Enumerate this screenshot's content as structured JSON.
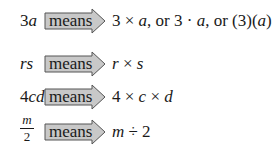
{
  "arrow": {
    "label": "means",
    "fill": "#c8c8c8",
    "stroke": "#555555"
  },
  "rows": [
    {
      "lhs_num": "3",
      "lhs_var": "a",
      "rhs": "3 × a, or 3 · a, or (3)(a)"
    },
    {
      "lhs_var": "rs",
      "rhs": "r × s"
    },
    {
      "lhs_num": "4",
      "lhs_var": "cd",
      "rhs": "4 × c × d"
    },
    {
      "lhs_frac_num": "m",
      "lhs_frac_den": "2",
      "rhs": "m ÷ 2"
    }
  ]
}
